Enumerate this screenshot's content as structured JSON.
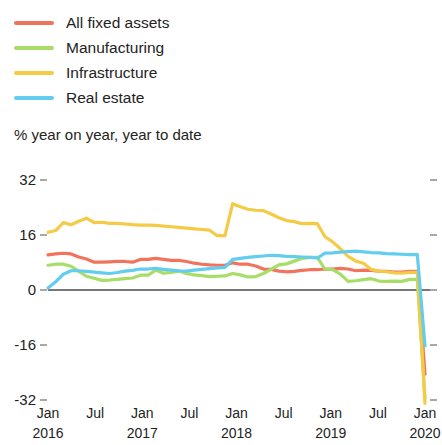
{
  "chart_data": {
    "type": "line",
    "title": "% year on year, year to date",
    "xlabel": "",
    "ylabel": "",
    "ylim": [
      -40,
      36
    ],
    "yticks": [
      32,
      16,
      0,
      -16,
      -32
    ],
    "ytick_labels": [
      "32",
      "16",
      "0",
      "-16",
      "-32"
    ],
    "grid": false,
    "legend_position": "top-left",
    "xtick_months": [
      "Jan",
      "Jul",
      "Jan",
      "Jul",
      "Jan",
      "Jul",
      "Jan",
      "Jul",
      "Jan"
    ],
    "xtick_years": [
      "2016",
      "",
      "2017",
      "",
      "2018",
      "",
      "2019",
      "",
      "2020"
    ],
    "x_start": "2016-01",
    "x_end": "2020-02",
    "x": [
      "2016-01",
      "2016-02",
      "2016-03",
      "2016-04",
      "2016-05",
      "2016-06",
      "2016-07",
      "2016-08",
      "2016-09",
      "2016-10",
      "2016-11",
      "2016-12",
      "2017-01",
      "2017-02",
      "2017-03",
      "2017-04",
      "2017-05",
      "2017-06",
      "2017-07",
      "2017-08",
      "2017-09",
      "2017-10",
      "2017-11",
      "2017-12",
      "2018-01",
      "2018-02",
      "2018-03",
      "2018-04",
      "2018-05",
      "2018-06",
      "2018-07",
      "2018-08",
      "2018-09",
      "2018-10",
      "2018-11",
      "2018-12",
      "2019-01",
      "2019-02",
      "2019-03",
      "2019-04",
      "2019-05",
      "2019-06",
      "2019-07",
      "2019-08",
      "2019-09",
      "2019-10",
      "2019-11",
      "2019-12",
      "2020-01",
      "2020-02"
    ],
    "series": [
      {
        "name": "All fixed assets",
        "color": "#f1735c",
        "values": [
          10.2,
          10.5,
          10.7,
          10.5,
          9.6,
          9.0,
          8.1,
          8.1,
          8.2,
          8.3,
          8.3,
          8.1,
          8.9,
          8.9,
          9.2,
          8.9,
          8.6,
          8.6,
          8.3,
          7.8,
          7.5,
          7.3,
          7.2,
          7.2,
          7.9,
          7.5,
          7.5,
          7.0,
          6.1,
          6.0,
          5.5,
          5.3,
          5.4,
          5.7,
          5.9,
          5.9,
          6.1,
          6.1,
          6.3,
          6.1,
          5.6,
          5.8,
          5.7,
          5.5,
          5.4,
          5.2,
          5.2,
          5.4,
          5.4,
          -24.5
        ]
      },
      {
        "name": "Manufacturing",
        "color": "#a6de68",
        "values": [
          7.2,
          7.5,
          7.5,
          6.9,
          5.4,
          4.0,
          3.4,
          2.8,
          2.9,
          3.1,
          3.3,
          3.5,
          4.3,
          4.3,
          5.8,
          4.9,
          5.1,
          5.5,
          4.8,
          4.4,
          4.2,
          3.9,
          4.0,
          4.1,
          4.8,
          4.4,
          3.8,
          3.9,
          4.8,
          6.0,
          7.3,
          7.6,
          8.4,
          9.2,
          9.5,
          9.5,
          6.1,
          5.9,
          4.6,
          2.5,
          2.7,
          3.0,
          3.3,
          2.6,
          2.5,
          2.6,
          2.5,
          3.1,
          3.1,
          -31.5
        ]
      },
      {
        "name": "Infrastructure",
        "color": "#f5cb45",
        "values": [
          16.8,
          17.3,
          19.6,
          19.0,
          20.0,
          20.9,
          19.6,
          19.7,
          19.4,
          19.4,
          19.2,
          19.0,
          18.9,
          18.9,
          18.8,
          18.6,
          18.4,
          18.2,
          18.0,
          17.8,
          17.6,
          17.4,
          15.8,
          15.8,
          25.1,
          24.2,
          23.5,
          23.2,
          23.1,
          22.1,
          21.0,
          20.2,
          19.9,
          19.3,
          19.4,
          19.3,
          15.5,
          14.0,
          12.0,
          9.8,
          8.4,
          7.8,
          6.0,
          5.5,
          5.3,
          5.0,
          4.9,
          5.1,
          5.1,
          -33.0
        ]
      },
      {
        "name": "Real estate",
        "color": "#63cdef",
        "values": [
          0.6,
          2.4,
          4.6,
          5.6,
          5.6,
          5.4,
          5.2,
          5.0,
          4.8,
          5.1,
          5.5,
          5.7,
          6.1,
          6.1,
          6.3,
          6.0,
          5.8,
          5.6,
          5.5,
          5.8,
          6.0,
          6.2,
          6.4,
          6.6,
          8.9,
          9.2,
          9.5,
          9.7,
          9.9,
          10.1,
          10.0,
          9.8,
          9.7,
          9.6,
          9.5,
          9.3,
          10.7,
          10.8,
          11.0,
          11.2,
          11.3,
          11.1,
          10.9,
          10.8,
          10.6,
          10.5,
          10.4,
          10.3,
          10.3,
          -16.3
        ]
      }
    ]
  },
  "legend": {
    "items": [
      {
        "label": "All fixed assets",
        "color": "#f1735c"
      },
      {
        "label": "Manufacturing",
        "color": "#a6de68"
      },
      {
        "label": "Infrastructure",
        "color": "#f5cb45"
      },
      {
        "label": "Real estate",
        "color": "#63cdef"
      }
    ]
  }
}
